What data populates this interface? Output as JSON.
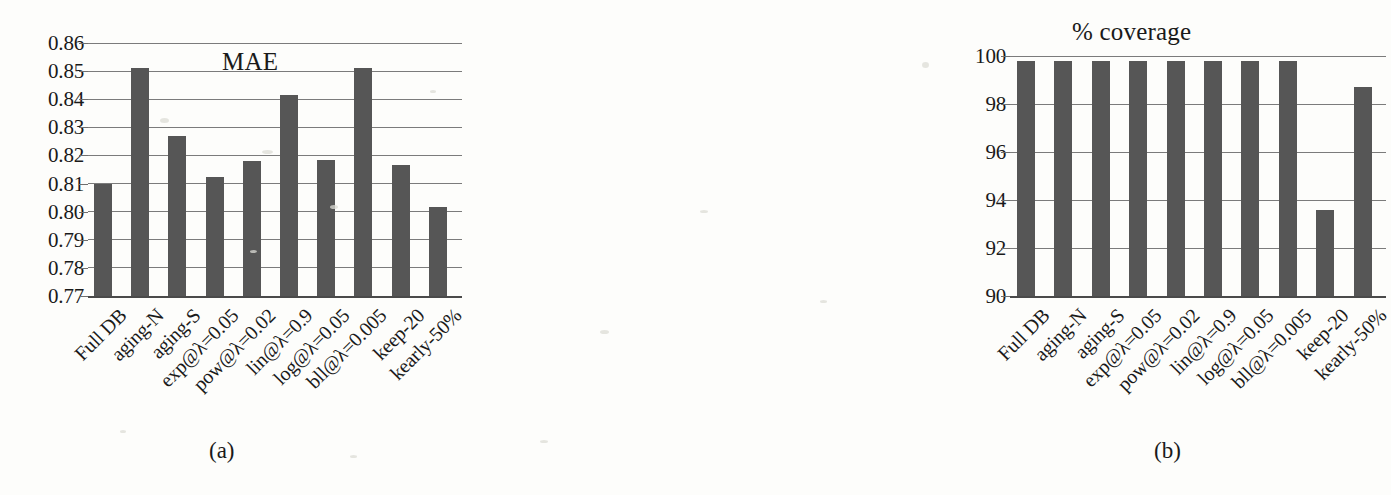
{
  "figure": {
    "background_color": "#fdfdfb",
    "bar_color": "#565656",
    "gridline_color": "#7b7b7b",
    "panels": [
      {
        "caption": "(a)"
      },
      {
        "caption": "(b)"
      }
    ]
  },
  "chart_data": [
    {
      "type": "bar",
      "title": "MAE",
      "xlabel": "",
      "ylabel": "",
      "ylim": [
        0.77,
        0.86
      ],
      "yticks": [
        "0.86",
        "0.85",
        "0.84",
        "0.83",
        "0.82",
        "0.81",
        "0.80",
        "0.79",
        "0.78",
        "0.77"
      ],
      "ytick_values": [
        0.86,
        0.85,
        0.84,
        0.83,
        0.82,
        0.81,
        0.8,
        0.79,
        0.78,
        0.77
      ],
      "grid": true,
      "legend": "none",
      "categories": [
        "Full DB",
        "aging-N",
        "aging-S",
        "exp@λ=0.05",
        "pow@λ=0.02",
        "lin@λ=0.9",
        "log@λ=0.05",
        "bll@λ=0.005",
        "keep-20",
        "kearly-50%"
      ],
      "values": [
        0.81,
        0.851,
        0.827,
        0.8125,
        0.818,
        0.8415,
        0.8185,
        0.851,
        0.8165,
        0.8015
      ],
      "caption": "(a)"
    },
    {
      "type": "bar",
      "title": "% coverage",
      "xlabel": "",
      "ylabel": "",
      "ylim": [
        90,
        100
      ],
      "yticks": [
        "100",
        "98",
        "96",
        "94",
        "92",
        "90"
      ],
      "ytick_values": [
        100,
        98,
        96,
        94,
        92,
        90
      ],
      "grid": true,
      "legend": "none",
      "categories": [
        "Full DB",
        "aging-N",
        "aging-S",
        "exp@λ=0.05",
        "pow@λ=0.02",
        "lin@λ=0.9",
        "log@λ=0.05",
        "bll@λ=0.005",
        "keep-20",
        "kearly-50%"
      ],
      "values": [
        99.8,
        99.8,
        99.8,
        99.8,
        99.8,
        99.8,
        99.8,
        99.8,
        93.6,
        98.7
      ],
      "caption": "(b)"
    }
  ]
}
